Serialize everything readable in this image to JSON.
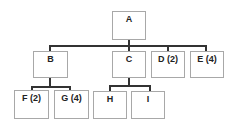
{
  "diagram": {
    "type": "org-chart",
    "nodes": [
      {
        "id": "A",
        "label": "A",
        "x": 112,
        "y": 11,
        "w": 34,
        "h": 29
      },
      {
        "id": "B",
        "label": "B",
        "x": 33,
        "y": 51,
        "w": 35,
        "h": 27
      },
      {
        "id": "C",
        "label": "C",
        "x": 112,
        "y": 51,
        "w": 34,
        "h": 27
      },
      {
        "id": "D",
        "label": "D (2)",
        "x": 151,
        "y": 51,
        "w": 34,
        "h": 27
      },
      {
        "id": "E",
        "label": "E (4)",
        "x": 190,
        "y": 51,
        "w": 34,
        "h": 27
      },
      {
        "id": "F",
        "label": "F (2)",
        "x": 14,
        "y": 90,
        "w": 35,
        "h": 29
      },
      {
        "id": "G",
        "label": "G (4)",
        "x": 54,
        "y": 90,
        "w": 35,
        "h": 29
      },
      {
        "id": "H",
        "label": "H",
        "x": 93,
        "y": 91,
        "w": 34,
        "h": 28
      },
      {
        "id": "I",
        "label": "I",
        "x": 131,
        "y": 91,
        "w": 34,
        "h": 28
      }
    ],
    "edges": [
      {
        "from": "A",
        "to": "B"
      },
      {
        "from": "A",
        "to": "C"
      },
      {
        "from": "A",
        "to": "D"
      },
      {
        "from": "A",
        "to": "E"
      },
      {
        "from": "B",
        "to": "F"
      },
      {
        "from": "B",
        "to": "G"
      },
      {
        "from": "C",
        "to": "H"
      },
      {
        "from": "C",
        "to": "I"
      }
    ],
    "colors": {
      "border": "#a8a8a8",
      "connector": "#333333",
      "text": "#222222",
      "background": "#ffffff"
    }
  }
}
